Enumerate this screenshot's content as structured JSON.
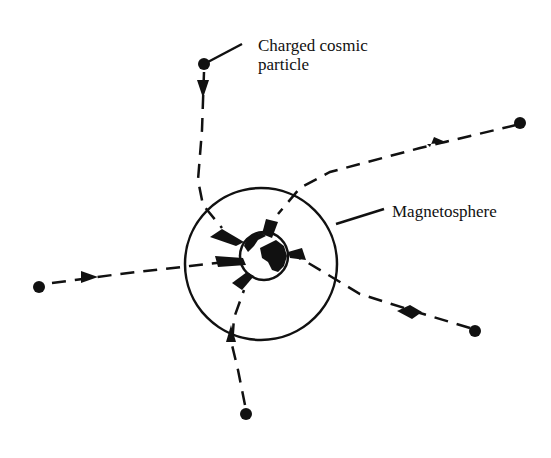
{
  "labels": {
    "particle": "Charged cosmic particle",
    "particle_line1": "Charged cosmic",
    "particle_line2": "particle",
    "magnetosphere": "Magnetosphere"
  },
  "colors": {
    "ink": "#111111",
    "background": "#ffffff"
  },
  "diagram": {
    "magnetosphere": {
      "cx": 261,
      "cy": 264,
      "r": 76
    },
    "earth": {
      "cx": 264,
      "cy": 256,
      "r": 24
    },
    "particles": [
      {
        "name": "top",
        "start": [
          204,
          64
        ]
      },
      {
        "name": "right-upper",
        "start": [
          520,
          123
        ]
      },
      {
        "name": "left",
        "start": [
          39,
          287
        ]
      },
      {
        "name": "right-lower",
        "start": [
          475,
          331
        ]
      },
      {
        "name": "bottom",
        "start": [
          246,
          414
        ]
      }
    ]
  }
}
